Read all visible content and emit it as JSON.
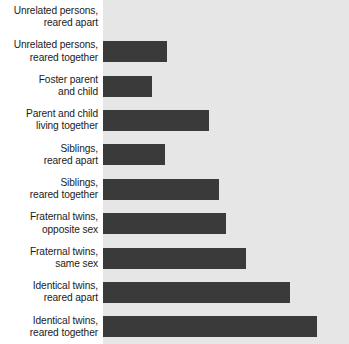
{
  "chart_data": {
    "type": "bar",
    "orientation": "horizontal",
    "title": "",
    "subtitle": "",
    "xlabel": "",
    "ylabel": "",
    "xlim": [
      0,
      1
    ],
    "grid": false,
    "legend": null,
    "bar_color": "#3a3a3a",
    "plot_background": "#e6e6e6",
    "page_background": "#ffffff",
    "categories": [
      "Unrelated persons,\nreared apart",
      "Unrelated persons,\nreared together",
      "Foster parent\nand child",
      "Parent and child\nliving together",
      "Siblings,\nreared apart",
      "Siblings,\nreared together",
      "Fraternal twins,\nopposite sex",
      "Fraternal twins,\nsame sex",
      "Identical twins,\nreared apart",
      "Identical twins,\nreared together"
    ],
    "values": [
      0.0,
      0.26,
      0.2,
      0.43,
      0.25,
      0.47,
      0.5,
      0.58,
      0.76,
      0.87
    ],
    "value_pct": [
      "0%",
      "26%",
      "20%",
      "43%",
      "25%",
      "47%",
      "50%",
      "58%",
      "76%",
      "87%"
    ]
  }
}
